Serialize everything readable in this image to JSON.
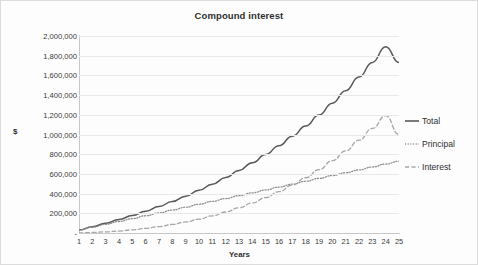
{
  "chart_data": {
    "type": "line",
    "title": "Compound interest",
    "xlabel": "Years",
    "ylabel": "$",
    "x": [
      1,
      2,
      3,
      4,
      5,
      6,
      7,
      8,
      9,
      10,
      11,
      12,
      13,
      14,
      15,
      16,
      17,
      18,
      19,
      20,
      21,
      22,
      23,
      24,
      25
    ],
    "xtick_labels": [
      "1",
      "2",
      "3",
      "4",
      "5",
      "6",
      "7",
      "8",
      "9",
      "10",
      "11",
      "12",
      "13",
      "14",
      "15",
      "16",
      "17",
      "18",
      "19",
      "20",
      "21",
      "22",
      "23",
      "24",
      "25"
    ],
    "ytick_labels": [
      "2,000,000",
      "1,800,000",
      "1,600,000",
      "1,400,000",
      "1,200,000",
      "1,000,000",
      "800,000",
      "600,000",
      "400,000",
      "200,000",
      "-"
    ],
    "ytick_values": [
      2000000,
      1800000,
      1600000,
      1400000,
      1200000,
      1000000,
      800000,
      600000,
      400000,
      200000,
      0
    ],
    "ylim": [
      0,
      2000000
    ],
    "xlim": [
      1,
      25
    ],
    "grid": true,
    "legend_position": "right",
    "series": [
      {
        "name": "Total",
        "style": "solid",
        "color": "#595959",
        "values": [
          31000,
          64000,
          99000,
          137000,
          178000,
          222000,
          269000,
          320000,
          374000,
          433000,
          495000,
          563000,
          635000,
          713000,
          796000,
          886000,
          982000,
          1086000,
          1197000,
          1317000,
          1445000,
          1583000,
          1732000,
          1891000,
          1730000
        ]
      },
      {
        "name": "Principal",
        "style": "dotted",
        "color": "#8c8c8c",
        "values": [
          30000,
          59000,
          88000,
          117000,
          146000,
          175000,
          204000,
          233000,
          262000,
          292000,
          321000,
          350000,
          379000,
          408000,
          437000,
          466000,
          496000,
          525000,
          554000,
          583000,
          612000,
          641000,
          670000,
          700000,
          729000
        ]
      },
      {
        "name": "Interest",
        "style": "dashed",
        "color": "#a6a6a6",
        "values": [
          1000,
          5000,
          11000,
          20000,
          32000,
          47000,
          65000,
          87000,
          112000,
          141000,
          174000,
          213000,
          256000,
          305000,
          359000,
          420000,
          486000,
          561000,
          643000,
          734000,
          833000,
          942000,
          1062000,
          1191000,
          1001000
        ]
      }
    ]
  },
  "legend": {
    "items": [
      {
        "label": "Total"
      },
      {
        "label": "Principal"
      },
      {
        "label": "Interest"
      }
    ]
  }
}
